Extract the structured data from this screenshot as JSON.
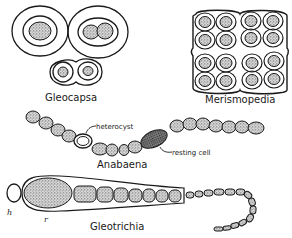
{
  "figure": {
    "organisms": [
      {
        "key": "gleocapsa",
        "label": "Gleocapsa"
      },
      {
        "key": "merismopedia",
        "label": "Merismopedia"
      },
      {
        "key": "anabaena",
        "label": "Anabaena"
      },
      {
        "key": "gleotrichia",
        "label": "Gleotrichia"
      }
    ],
    "annotations": {
      "heterocyst": "heterocyst",
      "resting_cell": "resting cell",
      "h": "h",
      "r": "r"
    },
    "colors": {
      "ink": "#1a1a1a",
      "stipple": "#9a9a9a",
      "background": "#ffffff"
    }
  }
}
